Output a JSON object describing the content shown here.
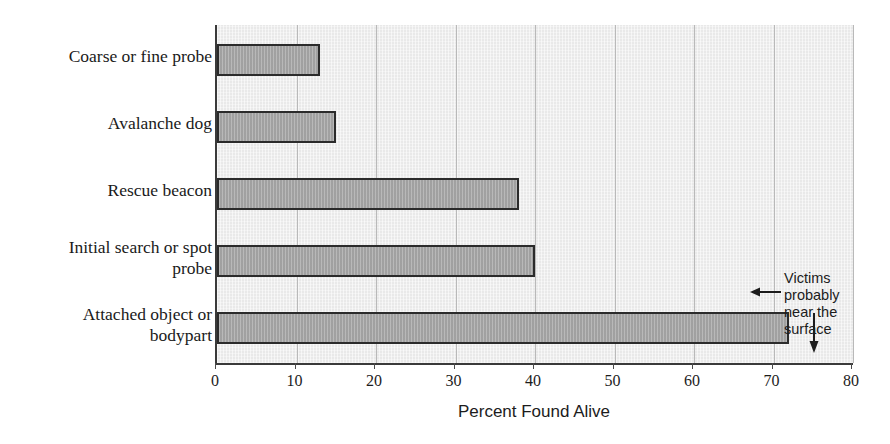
{
  "chart_data": {
    "type": "bar",
    "orientation": "horizontal",
    "title": "",
    "xlabel": "Percent Found Alive",
    "ylabel": "",
    "categories": [
      "Coarse or fine probe",
      "Avalanche dog",
      "Rescue beacon",
      "Initial search or spot\nprobe",
      "Attached object or\nbodypart"
    ],
    "values": [
      13,
      15,
      38,
      40,
      72
    ],
    "xlim": [
      0,
      80
    ],
    "xticks": [
      0,
      10,
      20,
      30,
      40,
      50,
      60,
      70,
      80
    ],
    "xtick_labels": [
      "0",
      "10",
      "20",
      "30",
      "40",
      "50",
      "60",
      "70",
      "80"
    ],
    "grid": true,
    "grid_axis": "x",
    "legend": false,
    "annotations": [
      {
        "text": "Victims probably\nnear the surface",
        "arrows": [
          "left-arrow-to-bar",
          "down-arrow-to-bar"
        ],
        "points_to_values": [
          40,
          48
        ]
      }
    ],
    "colors": {
      "bar_fill": "#a9a9a9",
      "bar_edge": "#2b2b2b",
      "plot_background": "#e9e9e9",
      "gridline": "#b9b9b9",
      "axis": "#3a3a3a",
      "text": "#1c1c1c",
      "page_background": "#ffffff"
    }
  }
}
